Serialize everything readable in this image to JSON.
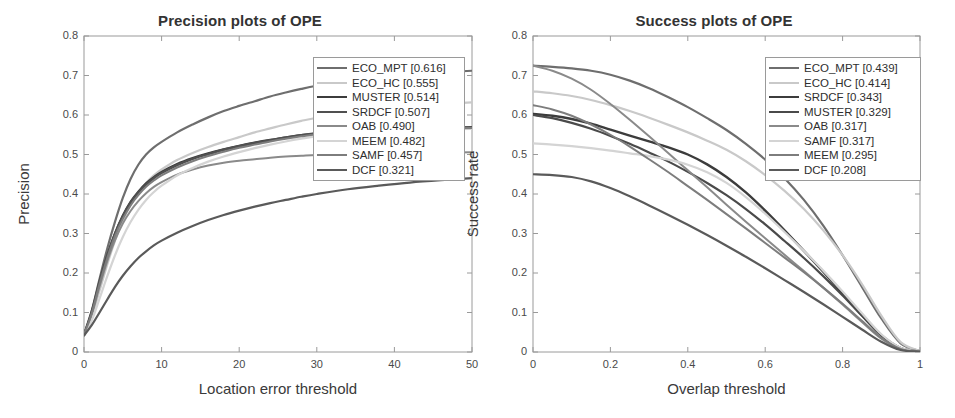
{
  "figure": {
    "background": "#ffffff",
    "axis_color": "#9a9a9a",
    "text_color": "#3a3a3a"
  },
  "chart_data": [
    {
      "type": "line",
      "panel": "left",
      "title": "Precision plots of OPE",
      "xlabel": "Location error threshold",
      "ylabel": "Precision",
      "xlim": [
        0,
        50
      ],
      "ylim": [
        0,
        0.8
      ],
      "xticks": [
        0,
        10,
        20,
        30,
        40,
        50
      ],
      "xtick_labels": [
        "0",
        "10",
        "20",
        "30",
        "40",
        "50"
      ],
      "yticks": [
        0,
        0.1,
        0.2,
        0.3,
        0.4,
        0.5,
        0.6,
        0.7,
        0.8
      ],
      "ytick_labels": [
        "0",
        "0.1",
        "0.2",
        "0.3",
        "0.4",
        "0.5",
        "0.6",
        "0.7",
        "0.8"
      ],
      "grid": false,
      "legend_position": "upper-right",
      "x": [
        0,
        1,
        2,
        3,
        4,
        5,
        6,
        7,
        8,
        9,
        10,
        12,
        14,
        16,
        18,
        20,
        22,
        24,
        26,
        28,
        30,
        34,
        38,
        42,
        46,
        50
      ],
      "series": [
        {
          "name": "ECO_MPT",
          "score": "0.616",
          "legend_label": "ECO_MPT [0.616]",
          "color": "#6e6e6e",
          "width": 2.2,
          "values": [
            0.045,
            0.105,
            0.185,
            0.262,
            0.33,
            0.39,
            0.438,
            0.474,
            0.5,
            0.518,
            0.532,
            0.556,
            0.576,
            0.594,
            0.61,
            0.623,
            0.635,
            0.647,
            0.657,
            0.666,
            0.674,
            0.688,
            0.697,
            0.703,
            0.708,
            0.712
          ]
        },
        {
          "name": "ECO_HC",
          "score": "0.555",
          "legend_label": "ECO_HC [0.555]",
          "color": "#c9c9c9",
          "width": 2.2,
          "values": [
            0.043,
            0.09,
            0.155,
            0.222,
            0.282,
            0.332,
            0.372,
            0.403,
            0.428,
            0.447,
            0.462,
            0.486,
            0.504,
            0.519,
            0.532,
            0.544,
            0.556,
            0.566,
            0.576,
            0.585,
            0.593,
            0.606,
            0.616,
            0.623,
            0.628,
            0.632
          ]
        },
        {
          "name": "MUSTER",
          "score": "0.514",
          "legend_label": "MUSTER [0.514]",
          "color": "#3c3c3c",
          "width": 2.2,
          "values": [
            0.042,
            0.1,
            0.175,
            0.243,
            0.3,
            0.345,
            0.38,
            0.406,
            0.427,
            0.443,
            0.456,
            0.476,
            0.491,
            0.503,
            0.513,
            0.522,
            0.53,
            0.537,
            0.543,
            0.549,
            0.553,
            0.558,
            0.561,
            0.563,
            0.565,
            0.566
          ]
        },
        {
          "name": "SRDCF",
          "score": "0.507",
          "legend_label": "SRDCF [0.507]",
          "color": "#505050",
          "width": 2.4,
          "values": [
            0.043,
            0.102,
            0.178,
            0.245,
            0.3,
            0.344,
            0.378,
            0.404,
            0.424,
            0.44,
            0.453,
            0.473,
            0.489,
            0.501,
            0.512,
            0.521,
            0.529,
            0.536,
            0.543,
            0.549,
            0.554,
            0.56,
            0.564,
            0.566,
            0.568,
            0.569
          ]
        },
        {
          "name": "OAB",
          "score": "0.490",
          "legend_label": "OAB [0.490]",
          "color": "#8a8a8a",
          "width": 2.0,
          "values": [
            0.042,
            0.095,
            0.165,
            0.23,
            0.283,
            0.325,
            0.357,
            0.382,
            0.402,
            0.418,
            0.43,
            0.449,
            0.462,
            0.472,
            0.479,
            0.484,
            0.488,
            0.492,
            0.495,
            0.497,
            0.499,
            0.501,
            0.503,
            0.504,
            0.505,
            0.506
          ]
        },
        {
          "name": "MEEM",
          "score": "0.482",
          "legend_label": "MEEM [0.482]",
          "color": "#d4d4d4",
          "width": 2.2,
          "values": [
            0.042,
            0.08,
            0.135,
            0.192,
            0.245,
            0.291,
            0.329,
            0.36,
            0.385,
            0.405,
            0.421,
            0.447,
            0.466,
            0.482,
            0.495,
            0.506,
            0.516,
            0.525,
            0.533,
            0.54,
            0.546,
            0.554,
            0.559,
            0.562,
            0.564,
            0.565
          ]
        },
        {
          "name": "SAMF",
          "score": "0.457",
          "legend_label": "SAMF [0.457]",
          "color": "#7d7d7d",
          "width": 2.0,
          "values": [
            0.043,
            0.098,
            0.172,
            0.238,
            0.294,
            0.337,
            0.371,
            0.397,
            0.418,
            0.434,
            0.447,
            0.467,
            0.483,
            0.496,
            0.507,
            0.517,
            0.525,
            0.533,
            0.54,
            0.546,
            0.551,
            0.558,
            0.562,
            0.564,
            0.566,
            0.567
          ]
        },
        {
          "name": "DCF",
          "score": "0.321",
          "legend_label": "DCF [0.321]",
          "color": "#5a5a5a",
          "width": 2.2,
          "values": [
            0.042,
            0.068,
            0.1,
            0.133,
            0.165,
            0.193,
            0.217,
            0.238,
            0.255,
            0.27,
            0.282,
            0.302,
            0.319,
            0.334,
            0.347,
            0.358,
            0.368,
            0.377,
            0.385,
            0.393,
            0.4,
            0.412,
            0.421,
            0.429,
            0.435,
            0.44
          ]
        }
      ]
    },
    {
      "type": "line",
      "panel": "right",
      "title": "Success plots of OPE",
      "xlabel": "Overlap threshold",
      "ylabel": "Success rate",
      "xlim": [
        0,
        1
      ],
      "ylim": [
        0,
        0.8
      ],
      "xticks": [
        0,
        0.2,
        0.4,
        0.6,
        0.8,
        1
      ],
      "xtick_labels": [
        "0",
        "0.2",
        "0.4",
        "0.6",
        "0.8",
        "1"
      ],
      "yticks": [
        0,
        0.1,
        0.2,
        0.3,
        0.4,
        0.5,
        0.6,
        0.7,
        0.8
      ],
      "ytick_labels": [
        "0",
        "0.1",
        "0.2",
        "0.3",
        "0.4",
        "0.5",
        "0.6",
        "0.7",
        "0.8"
      ],
      "grid": false,
      "legend_position": "upper-right",
      "x": [
        0,
        0.05,
        0.1,
        0.15,
        0.2,
        0.25,
        0.3,
        0.35,
        0.4,
        0.45,
        0.5,
        0.55,
        0.6,
        0.65,
        0.7,
        0.75,
        0.8,
        0.85,
        0.9,
        0.95,
        1
      ],
      "series": [
        {
          "name": "ECO_MPT",
          "score": "0.439",
          "legend_label": "ECO_MPT [0.439]",
          "color": "#6e6e6e",
          "width": 2.2,
          "values": [
            0.725,
            0.722,
            0.718,
            0.712,
            0.702,
            0.687,
            0.668,
            0.645,
            0.62,
            0.592,
            0.562,
            0.527,
            0.487,
            0.44,
            0.385,
            0.32,
            0.245,
            0.165,
            0.085,
            0.022,
            0.002
          ]
        },
        {
          "name": "ECO_HC",
          "score": "0.414",
          "legend_label": "ECO_HC [0.414]",
          "color": "#c9c9c9",
          "width": 2.2,
          "values": [
            0.66,
            0.655,
            0.648,
            0.638,
            0.625,
            0.61,
            0.593,
            0.575,
            0.556,
            0.535,
            0.512,
            0.483,
            0.448,
            0.408,
            0.362,
            0.308,
            0.245,
            0.172,
            0.092,
            0.025,
            0.002
          ]
        },
        {
          "name": "SRDCF",
          "score": "0.343",
          "legend_label": "SRDCF [0.343]",
          "color": "#3c3c3c",
          "width": 2.4,
          "values": [
            0.603,
            0.598,
            0.59,
            0.578,
            0.563,
            0.548,
            0.533,
            0.518,
            0.5,
            0.475,
            0.443,
            0.404,
            0.358,
            0.308,
            0.256,
            0.203,
            0.148,
            0.093,
            0.042,
            0.01,
            0.001
          ]
        },
        {
          "name": "MUSTER",
          "score": "0.329",
          "legend_label": "MUSTER [0.329]",
          "color": "#4a4a4a",
          "width": 2.2,
          "values": [
            0.6,
            0.592,
            0.58,
            0.565,
            0.547,
            0.527,
            0.505,
            0.482,
            0.456,
            0.428,
            0.397,
            0.362,
            0.323,
            0.281,
            0.238,
            0.192,
            0.143,
            0.092,
            0.043,
            0.01,
            0.001
          ]
        },
        {
          "name": "OAB",
          "score": "0.317",
          "legend_label": "OAB [0.317]",
          "color": "#8a8a8a",
          "width": 2.0,
          "values": [
            0.725,
            0.712,
            0.692,
            0.664,
            0.628,
            0.588,
            0.546,
            0.503,
            0.46,
            0.417,
            0.373,
            0.33,
            0.288,
            0.246,
            0.205,
            0.163,
            0.12,
            0.076,
            0.034,
            0.008,
            0.001
          ]
        },
        {
          "name": "SAMF",
          "score": "0.317",
          "legend_label": "SAMF [0.317]",
          "color": "#d4d4d4",
          "width": 2.2,
          "values": [
            0.528,
            0.525,
            0.521,
            0.516,
            0.51,
            0.503,
            0.496,
            0.487,
            0.474,
            0.455,
            0.428,
            0.392,
            0.35,
            0.304,
            0.256,
            0.206,
            0.153,
            0.098,
            0.045,
            0.011,
            0.001
          ]
        },
        {
          "name": "MEEM",
          "score": "0.295",
          "legend_label": "MEEM [0.295]",
          "color": "#7d7d7d",
          "width": 2.0,
          "values": [
            0.625,
            0.614,
            0.598,
            0.576,
            0.55,
            0.52,
            0.488,
            0.455,
            0.42,
            0.385,
            0.349,
            0.313,
            0.276,
            0.239,
            0.202,
            0.163,
            0.122,
            0.079,
            0.036,
            0.008,
            0.001
          ]
        },
        {
          "name": "DCF",
          "score": "0.208",
          "legend_label": "DCF [0.208]",
          "color": "#5a5a5a",
          "width": 2.2,
          "values": [
            0.45,
            0.448,
            0.443,
            0.432,
            0.415,
            0.394,
            0.371,
            0.347,
            0.322,
            0.296,
            0.269,
            0.241,
            0.212,
            0.182,
            0.152,
            0.121,
            0.089,
            0.057,
            0.026,
            0.005,
            0.001
          ]
        }
      ]
    }
  ]
}
